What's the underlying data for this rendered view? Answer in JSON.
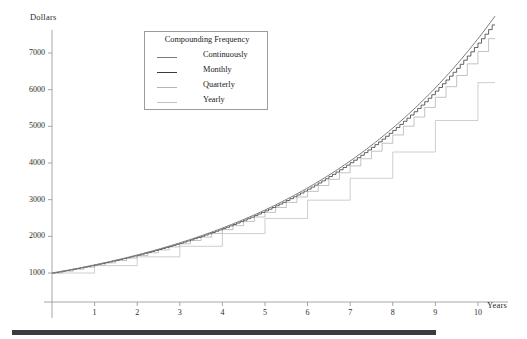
{
  "chart_data": {
    "type": "line",
    "title": "",
    "xlabel": "Years",
    "ylabel": "Dollars",
    "xlim": [
      0,
      10.4
    ],
    "ylim": [
      700,
      7500
    ],
    "xticks": [
      1,
      2,
      3,
      4,
      5,
      6,
      7,
      8,
      9,
      10
    ],
    "yticks": [
      1000,
      2000,
      3000,
      4000,
      5000,
      6000,
      7000
    ],
    "grid": false,
    "legend": {
      "title": "Compounding Frequency",
      "position": "upper-left-inside",
      "entries": [
        {
          "label": "Continuously",
          "color": "#7a7a7a",
          "style": "smooth-curve"
        },
        {
          "label": "Monthly",
          "color": "#3b3b3b",
          "style": "fine-steps"
        },
        {
          "label": "Quarterly",
          "color": "#b4b4b4",
          "style": "medium-steps"
        },
        {
          "label": "Yearly",
          "color": "#c2c2c2",
          "style": "large-steps"
        }
      ]
    },
    "principal": 1000,
    "annual_rate": 0.2,
    "x": [
      0,
      1,
      2,
      3,
      4,
      5,
      6,
      7,
      8,
      9,
      10
    ],
    "series": [
      {
        "name": "Continuously",
        "color": "#7a7a7a",
        "step": "none",
        "values": [
          1000,
          1221,
          1492,
          1822,
          2226,
          2718,
          3320,
          4055,
          4953,
          6050,
          7389
        ]
      },
      {
        "name": "Monthly",
        "color": "#3b3b3b",
        "step": "monthly",
        "periods_per_year": 12,
        "values": [
          1000,
          1219,
          1486,
          1812,
          2209,
          2694,
          3284,
          4004,
          4881,
          5951,
          7257
        ]
      },
      {
        "name": "Quarterly",
        "color": "#b4b4b4",
        "step": "quarterly",
        "periods_per_year": 4,
        "values": [
          1000,
          1216,
          1477,
          1796,
          2183,
          2653,
          3225,
          3920,
          4765,
          5792,
          7040
        ]
      },
      {
        "name": "Yearly",
        "color": "#c2c2c2",
        "step": "yearly",
        "periods_per_year": 1,
        "values": [
          1000,
          1200,
          1440,
          1728,
          2074,
          2488,
          2986,
          3583,
          4300,
          5160,
          6192
        ]
      }
    ]
  },
  "figure": {
    "background": "#ffffff",
    "axis_color": "#8f8f8f",
    "footer_bar_color": "#3a3a42"
  }
}
